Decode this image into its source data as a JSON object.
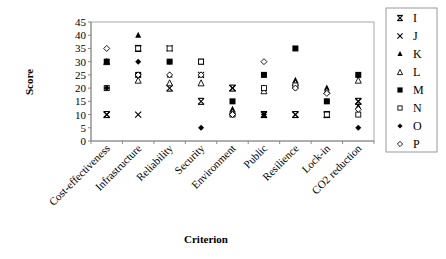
{
  "chart_data": {
    "type": "scatter",
    "title": "",
    "xlabel": "Criterion",
    "ylabel": "Score",
    "ylim": [
      0,
      45
    ],
    "yticks": [
      0,
      5,
      10,
      15,
      20,
      25,
      30,
      35,
      40,
      45
    ],
    "grid": false,
    "legend_position": "right",
    "categories": [
      "Cost-effectiveness",
      "Infrastructure",
      "Reliability",
      "Security",
      "Environment",
      "Public",
      "Resilience",
      "Lock-in",
      "CO2 reduction"
    ],
    "series": [
      {
        "name": "I",
        "marker": "asterisk",
        "values": [
          10,
          35,
          20,
          15,
          20,
          10,
          10,
          10,
          15
        ]
      },
      {
        "name": "J",
        "marker": "x",
        "values": [
          10,
          10,
          35,
          25,
          20,
          10,
          10,
          10,
          15
        ]
      },
      {
        "name": "K",
        "marker": "triangle-filled",
        "values": [
          30,
          40,
          25,
          25,
          12,
          20,
          23,
          20,
          13
        ]
      },
      {
        "name": "L",
        "marker": "triangle-open",
        "values": [
          30,
          23,
          22,
          22,
          11,
          19,
          22,
          19,
          23
        ]
      },
      {
        "name": "M",
        "marker": "square-filled",
        "values": [
          30,
          25,
          30,
          30,
          15,
          25,
          35,
          15,
          25
        ]
      },
      {
        "name": "N",
        "marker": "square-open",
        "values": [
          20,
          35,
          35,
          30,
          10,
          20,
          21,
          10,
          10
        ]
      },
      {
        "name": "O",
        "marker": "diamond-filled",
        "values": [
          20,
          30,
          30,
          5,
          10,
          10,
          20,
          15,
          5
        ]
      },
      {
        "name": "P",
        "marker": "diamond-open",
        "values": [
          35,
          25,
          25,
          25,
          10,
          30,
          20,
          18,
          12
        ]
      }
    ]
  }
}
